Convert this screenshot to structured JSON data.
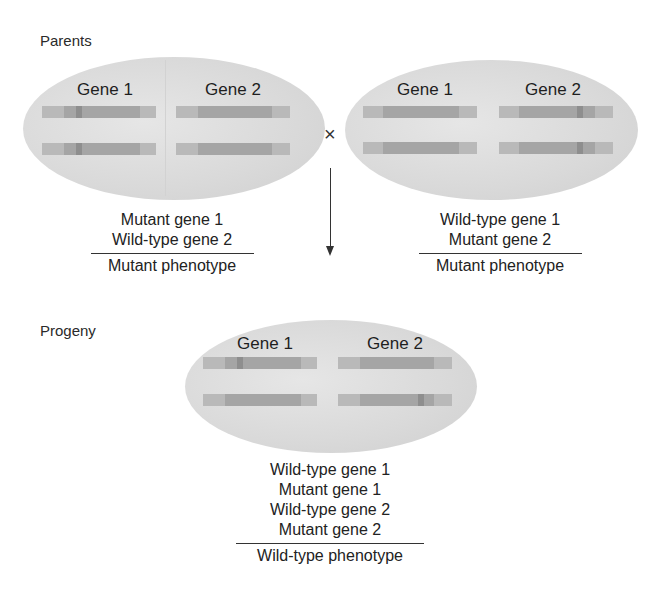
{
  "sections": {
    "parents_label": "Parents",
    "progeny_label": "Progeny"
  },
  "cross_symbol": "×",
  "parents": [
    {
      "genes": [
        {
          "title": "Gene 1",
          "alleles": [
            "mutant",
            "mutant"
          ]
        },
        {
          "title": "Gene 2",
          "alleles": [
            "wild-type",
            "wild-type"
          ]
        }
      ],
      "genotype": [
        "Mutant gene 1",
        "Wild-type gene 2"
      ],
      "phenotype": "Mutant phenotype"
    },
    {
      "genes": [
        {
          "title": "Gene 1",
          "alleles": [
            "wild-type",
            "wild-type"
          ]
        },
        {
          "title": "Gene 2",
          "alleles": [
            "mutant",
            "mutant"
          ]
        }
      ],
      "genotype": [
        "Wild-type gene 1",
        "Mutant gene 2"
      ],
      "phenotype": "Mutant phenotype"
    }
  ],
  "progeny": {
    "genes": [
      {
        "title": "Gene 1",
        "alleles": [
          "mutant",
          "wild-type"
        ]
      },
      {
        "title": "Gene 2",
        "alleles": [
          "wild-type",
          "mutant"
        ]
      }
    ],
    "genotype": [
      "Wild-type gene 1",
      "Mutant gene 1",
      "Wild-type gene 2",
      "Mutant gene 2"
    ],
    "phenotype": "Wild-type phenotype"
  },
  "colors": {
    "cell_fill": "#d9d9d9",
    "chromosome": "#b9b9b9",
    "gene_region": "#a5a5a5",
    "mutation_mark": "#8e8e8e",
    "text": "#222222"
  }
}
